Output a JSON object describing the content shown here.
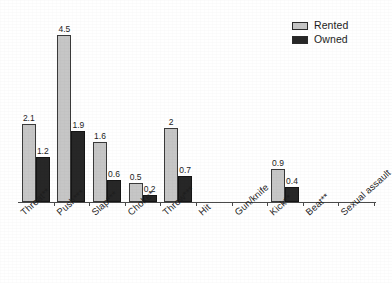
{
  "chart_data": {
    "type": "bar",
    "title": "",
    "subtitle": "",
    "xlabel": "",
    "ylabel": "",
    "grid": false,
    "legend_position": "top-right",
    "ylim": [
      0,
      5
    ],
    "categories": [
      "Threat**",
      "Push***",
      "Slap***",
      "Choke*",
      "Throw***",
      "Hit",
      "Gun/knife",
      "Kick**",
      "Beat**",
      "Sexual assault"
    ],
    "series": [
      {
        "name": "Rented",
        "color": "#c6c6c6",
        "values": [
          2.1,
          4.5,
          1.6,
          0.5,
          2,
          0,
          0,
          0.9,
          0,
          0
        ],
        "labels": [
          "2.1",
          "4.5",
          "1.6",
          "0.5",
          "2",
          "",
          "",
          "0.9",
          "",
          ""
        ]
      },
      {
        "name": "Owned",
        "color": "#272727",
        "values": [
          1.2,
          1.9,
          0.6,
          0.2,
          0.7,
          0,
          0,
          0.4,
          0,
          0
        ],
        "labels": [
          "1.2",
          "1.9",
          "0.6",
          "0.2",
          "0.7",
          "",
          "",
          "0.4",
          "",
          ""
        ]
      }
    ]
  },
  "legend": {
    "items": [
      {
        "label": "Rented",
        "swatch": "#c6c6c6"
      },
      {
        "label": "Owned",
        "swatch": "#272727"
      }
    ]
  }
}
